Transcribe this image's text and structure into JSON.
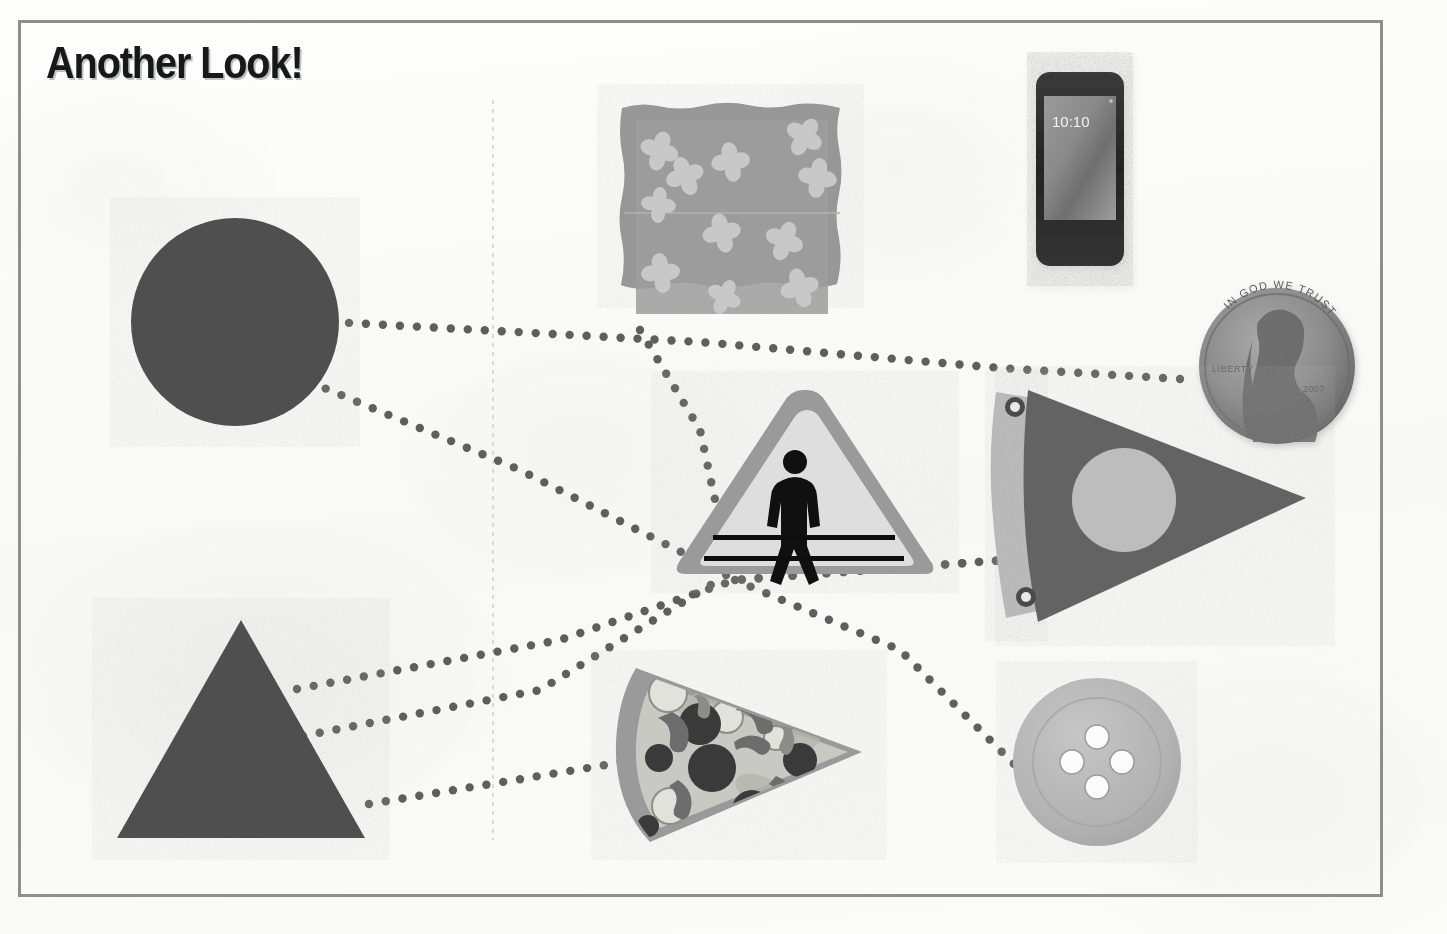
{
  "page": {
    "title": "Another Look!",
    "background_color": "#fcfcfb",
    "border_color": "#8e8e8e",
    "fold_line_color": "#d9d9d6",
    "width": 1447,
    "height": 934
  },
  "palette": {
    "dark_gray": "#4f4f4f",
    "mid_gray": "#808080",
    "napkin_gray": "#979797",
    "napkin_border_gray": "#8a8a8a",
    "napkin_flower": "#c6c6c6",
    "light_gray": "#bdbdbd",
    "button_gray": "#b4b4b4",
    "sign_border": "#9a9a9a",
    "sign_face": "#dcdcdc",
    "black": "#101010",
    "white": "#ffffff",
    "phone_bezel": "#2b2b2b",
    "penny_gray": "#8d8d8d",
    "pizza_crust": "#9a9a9a",
    "pizza_cheese": "#c9c9c4",
    "dot_color": "#5e5e5e"
  },
  "left_column": {
    "label": "shape-key-column",
    "shapes": [
      {
        "name": "circle",
        "shape_label": "Circle",
        "fill": "#4f4f4f",
        "cx": 235,
        "cy": 322,
        "r": 104
      },
      {
        "name": "triangle",
        "shape_label": "Triangle",
        "fill": "#4f4f4f",
        "points": "241,620 365,838 117,838"
      }
    ]
  },
  "objects": [
    {
      "name": "napkin",
      "object_label": "Napkin",
      "x": 620,
      "y": 104,
      "width": 222,
      "height": 224,
      "flower_count": 11,
      "has_fold_line": true
    },
    {
      "name": "phone",
      "object_label": "Phone",
      "x": 1036,
      "y": 72,
      "width": 88,
      "height": 194,
      "screen_time": "10:10"
    },
    {
      "name": "penny",
      "object_label": "Penny",
      "cx": 1277,
      "cy": 366,
      "r": 78,
      "motto": "IN GOD WE TRUST",
      "liberty": "LIBERTY",
      "date": "2007"
    },
    {
      "name": "crossing-sign",
      "object_label": "Pedestrian crossing sign",
      "x": 678,
      "y": 386,
      "width": 258,
      "height": 190
    },
    {
      "name": "pennant-flag",
      "object_label": "Pennant flag",
      "x": 994,
      "y": 389,
      "width": 312,
      "height": 234
    },
    {
      "name": "pizza-slice",
      "object_label": "Pizza slice",
      "x": 613,
      "y": 662,
      "width": 254,
      "height": 178
    },
    {
      "name": "button",
      "object_label": "Button",
      "cx": 1097,
      "cy": 762,
      "r": 84,
      "hole_count": 4
    }
  ],
  "matching_lines": [
    {
      "name": "circle-to-penny",
      "from": "circle",
      "to": "penny",
      "path": "332,322 700,342 1000,368 1196,380"
    },
    {
      "name": "circle-to-pennant",
      "from": "circle",
      "to": "pennant-flag",
      "path": "310,382 520,470 736,580 1005,560"
    },
    {
      "name": "triangle-to-pennant",
      "from": "triangle",
      "to": "pennant-flag",
      "path": "297,689 560,640 735,580 1005,560"
    },
    {
      "name": "triangle-to-sign",
      "from": "triangle",
      "to": "crossing-sign",
      "path": "303,736 540,690 722,578"
    },
    {
      "name": "triangle-to-pizza",
      "from": "triangle",
      "to": "pizza-slice",
      "path": "369,804 600,766 640,758"
    },
    {
      "name": "sign-to-button",
      "from": "crossing-sign",
      "to": "button",
      "path": "735,580 900,650 1020,770"
    },
    {
      "name": "napkin-to-sign",
      "from": "napkin",
      "to": "crossing-sign",
      "path": "640,330 700,430 728,560"
    }
  ],
  "dot": {
    "radius": 4.2,
    "spacing": 17,
    "color": "#5e5e5e"
  }
}
